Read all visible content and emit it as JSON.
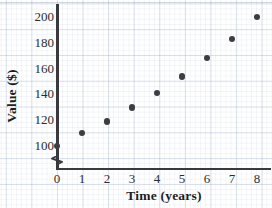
{
  "chart_data": {
    "type": "scatter",
    "title": "",
    "xlabel": "Time (years)",
    "ylabel": "Value ($)",
    "x": [
      0,
      1,
      2,
      3,
      4,
      5,
      6,
      7,
      8
    ],
    "values": [
      100,
      110,
      119,
      130,
      141,
      154,
      168,
      183,
      200
    ],
    "series": [
      {
        "name": "Value",
        "values": [
          100,
          110,
          119,
          130,
          141,
          154,
          168,
          183,
          200
        ]
      }
    ],
    "xtick_labels": [
      "0",
      "1",
      "2",
      "3",
      "4",
      "5",
      "6",
      "7",
      "8"
    ],
    "ytick_labels": [
      "100",
      "120",
      "140",
      "160",
      "180",
      "200"
    ],
    "xlim": [
      0,
      8.6
    ],
    "ylim": [
      100,
      207
    ],
    "grid": true,
    "legend": false,
    "axis_break_y": true,
    "marker_color": "#3c3c42",
    "axis_color": "#3a3a3e",
    "grid_color": "#96aac8"
  },
  "axes": {
    "x_title": "Time (years)",
    "y_title": "Value ($)",
    "x_ticks": [
      "0",
      "1",
      "2",
      "3",
      "4",
      "5",
      "6",
      "7",
      "8"
    ],
    "y_ticks": [
      "200",
      "180",
      "160",
      "140",
      "120",
      "100"
    ]
  }
}
